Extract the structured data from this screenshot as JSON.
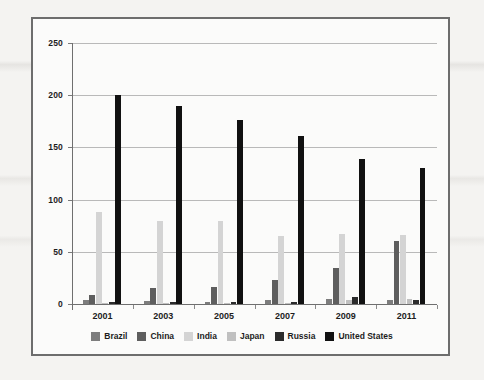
{
  "chart_data": {
    "type": "bar",
    "title": "",
    "xlabel": "",
    "ylabel": "",
    "ylim": [
      0,
      250
    ],
    "ytick_labels": [
      "0",
      "50",
      "100",
      "150",
      "200",
      "250"
    ],
    "ytick_values": [
      0,
      50,
      100,
      150,
      200,
      250
    ],
    "grid": true,
    "legend_position": "bottom",
    "categories": [
      "2001",
      "2003",
      "2005",
      "2007",
      "2009",
      "2011"
    ],
    "series": [
      {
        "name": "Brazil",
        "color": "#7d7d7d",
        "values": [
          4,
          3,
          2,
          4,
          5,
          4
        ]
      },
      {
        "name": "China",
        "color": "#5e5e5e",
        "values": [
          9,
          15,
          16,
          23,
          35,
          60
        ]
      },
      {
        "name": "India",
        "color": "#d4d4d4",
        "values": [
          88,
          80,
          80,
          65,
          67,
          66
        ]
      },
      {
        "name": "Japan",
        "color": "#c0c0c0",
        "values": [
          1,
          1,
          1,
          1,
          4,
          5
        ]
      },
      {
        "name": "Russia",
        "color": "#2b2b2b",
        "values": [
          2,
          2,
          2,
          2,
          7,
          4
        ]
      },
      {
        "name": "United States",
        "color": "#111111",
        "values": [
          200,
          190,
          176,
          161,
          139,
          130
        ]
      }
    ]
  },
  "legend": {
    "items": [
      {
        "label": "Brazil",
        "swatch": "#7d7d7d"
      },
      {
        "label": "China",
        "swatch": "#5e5e5e"
      },
      {
        "label": "India",
        "swatch": "#d4d4d4"
      },
      {
        "label": "Japan",
        "swatch": "#c0c0c0"
      },
      {
        "label": "Russia",
        "swatch": "#2b2b2b"
      },
      {
        "label": "United States",
        "swatch": "#111111"
      }
    ]
  }
}
